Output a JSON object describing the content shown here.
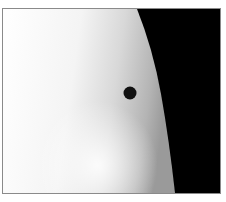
{
  "image": {
    "subject": "Planet transiting the solar disk near the limb",
    "colors": {
      "sky": "#000000",
      "sun_bright": "#ffffff",
      "sun_limb": "#a0a0a0",
      "planet": "#111111",
      "frame_border": "#8a8a8a"
    },
    "planet": {
      "cx": 127,
      "cy": 84,
      "r": 6.5
    }
  }
}
